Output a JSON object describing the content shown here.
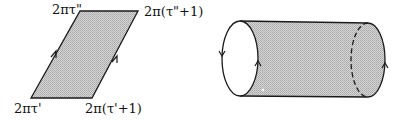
{
  "figure_left": {
    "shape": "parallelogram",
    "labels": {
      "top_left": "2πτ\"",
      "top_right": "2π(τ\"+1)",
      "bottom_left": "2πτ'",
      "bottom_right": "2π(τ'+1)"
    },
    "vertices": {
      "top_left": [
        80,
        11
      ],
      "top_right": [
        138,
        11
      ],
      "bottom_right": [
        92,
        98
      ],
      "bottom_left": [
        31,
        98
      ]
    },
    "arrows": [
      "left-edge-up",
      "right-edge-up"
    ]
  },
  "figure_right": {
    "shape": "cylinder",
    "left_end": "solid-ellipse",
    "right_end": "dashed-inner-arc-with-solid-outer-arc",
    "arrows": [
      "left-ellipse-left-down",
      "left-ellipse-right-up",
      "right-end-up"
    ]
  },
  "colors": {
    "stroke": "#1a1a1a",
    "fill": "#c4c4c4",
    "fill_light": "#d6d6d6",
    "background": "#ffffff"
  }
}
